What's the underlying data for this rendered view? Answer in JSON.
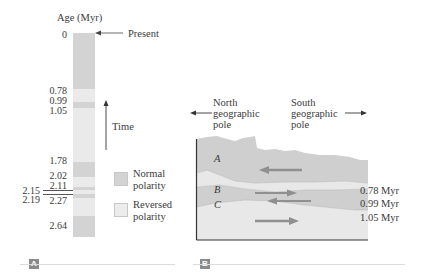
{
  "panel_a": {
    "axis_title": "Age (Myr)",
    "present_label": "Present",
    "time_label": "Time",
    "ticks": [
      "0",
      "0.78",
      "0.99",
      "1.05",
      "1.78",
      "2.02",
      "2.11",
      "2.15",
      "2.19",
      "2.27",
      "2.64"
    ],
    "legend": {
      "normal_line1": "Normal",
      "normal_line2": "polarity",
      "reversed_line1": "Reversed",
      "reversed_line2": "polarity"
    },
    "panel_label": "A",
    "colors": {
      "normal": "#d3d3d3",
      "reversed": "#eaeaea"
    }
  },
  "panel_b": {
    "north_line1": "North",
    "north_line2": "geographic",
    "north_line3": "pole",
    "south_line1": "South",
    "south_line2": "geographic",
    "south_line3": "pole",
    "layers": [
      "A",
      "B",
      "C"
    ],
    "boundary_labels": [
      "0.78 Myr",
      "0.99 Myr",
      "1.05 Myr"
    ],
    "panel_label": "B",
    "colors": {
      "normal": "#cfcfcf",
      "reversed": "#e8e8e8",
      "arrow": "#909090"
    }
  }
}
